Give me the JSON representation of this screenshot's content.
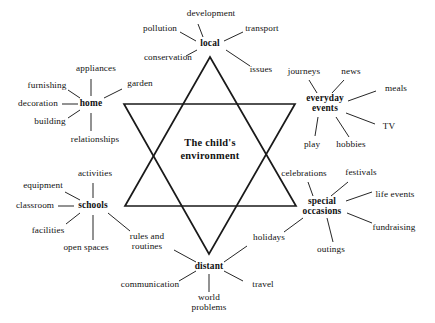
{
  "diagram": {
    "title": "The child's environment",
    "center": {
      "label": "The child's\nenvironment",
      "x": 210,
      "y": 150
    },
    "star": {
      "stroke_color": "#1a1a1a",
      "stroke_width": 1.7,
      "up_triangle": [
        [
          210,
          57
        ],
        [
          296,
          206
        ],
        [
          125,
          206
        ]
      ],
      "down_triangle": [
        [
          124,
          104
        ],
        [
          295,
          104
        ],
        [
          209,
          254
        ]
      ]
    },
    "nodes": [
      {
        "id": "local",
        "label": "local",
        "x": 210,
        "y": 44,
        "w": 30,
        "h": 11,
        "children": [
          {
            "label": "development",
            "x": 211,
            "y": 14,
            "anchor": "center"
          },
          {
            "label": "pollution",
            "x": 160,
            "y": 29,
            "anchor": "center"
          },
          {
            "label": "transport",
            "x": 262,
            "y": 29,
            "anchor": "center"
          },
          {
            "label": "conservation",
            "x": 168,
            "y": 58,
            "anchor": "center"
          },
          {
            "label": "issues",
            "x": 261,
            "y": 70,
            "anchor": "center"
          }
        ]
      },
      {
        "id": "home",
        "label": "home",
        "x": 91,
        "y": 104,
        "w": 28,
        "h": 11,
        "children": [
          {
            "label": "appliances",
            "x": 96,
            "y": 69,
            "anchor": "center"
          },
          {
            "label": "furnishing",
            "x": 47,
            "y": 86,
            "anchor": "center"
          },
          {
            "label": "garden",
            "x": 140,
            "y": 84,
            "anchor": "center"
          },
          {
            "label": "decoration",
            "x": 38,
            "y": 104,
            "anchor": "center"
          },
          {
            "label": "building",
            "x": 50,
            "y": 122,
            "anchor": "center"
          },
          {
            "label": "relationships",
            "x": 95,
            "y": 140,
            "anchor": "center"
          }
        ]
      },
      {
        "id": "schools",
        "label": "schools",
        "x": 93,
        "y": 206,
        "w": 34,
        "h": 11,
        "children": [
          {
            "label": "activities",
            "x": 95,
            "y": 174,
            "anchor": "center"
          },
          {
            "label": "equipment",
            "x": 43,
            "y": 186,
            "anchor": "center"
          },
          {
            "label": "classroom",
            "x": 35,
            "y": 206,
            "anchor": "center"
          },
          {
            "label": "facilities",
            "x": 48,
            "y": 231,
            "anchor": "center"
          },
          {
            "label": "open spaces",
            "x": 86,
            "y": 248,
            "anchor": "center"
          },
          {
            "label": "rules and\nroutines",
            "x": 147,
            "y": 242,
            "anchor": "center"
          }
        ]
      },
      {
        "id": "everyday-events",
        "label": "everyday\nevents",
        "x": 325,
        "y": 104,
        "w": 42,
        "h": 21,
        "children": [
          {
            "label": "journeys",
            "x": 304,
            "y": 72,
            "anchor": "center"
          },
          {
            "label": "news",
            "x": 351,
            "y": 72,
            "anchor": "center"
          },
          {
            "label": "meals",
            "x": 396,
            "y": 89,
            "anchor": "center"
          },
          {
            "label": "TV",
            "x": 389,
            "y": 127,
            "anchor": "center"
          },
          {
            "label": "hobbies",
            "x": 351,
            "y": 145,
            "anchor": "center"
          },
          {
            "label": "play",
            "x": 312,
            "y": 145,
            "anchor": "center"
          }
        ]
      },
      {
        "id": "special-occasions",
        "label": "special\noccasions",
        "x": 322,
        "y": 207,
        "w": 44,
        "h": 21,
        "children": [
          {
            "label": "celebrations",
            "x": 304,
            "y": 174,
            "anchor": "center"
          },
          {
            "label": "festivals",
            "x": 361,
            "y": 173,
            "anchor": "center"
          },
          {
            "label": "life events",
            "x": 395,
            "y": 195,
            "anchor": "center"
          },
          {
            "label": "fundraising",
            "x": 394,
            "y": 228,
            "anchor": "center"
          },
          {
            "label": "outings",
            "x": 331,
            "y": 250,
            "anchor": "center"
          },
          {
            "label": "holidays",
            "x": 269,
            "y": 238,
            "anchor": "center"
          }
        ]
      },
      {
        "id": "distant",
        "label": "distant",
        "x": 209,
        "y": 267,
        "w": 32,
        "h": 11,
        "children": [
          {
            "label": "communication",
            "x": 150,
            "y": 285,
            "anchor": "center"
          },
          {
            "label": "world\nproblems",
            "x": 209,
            "y": 303,
            "anchor": "center"
          },
          {
            "label": "travel",
            "x": 263,
            "y": 285,
            "anchor": "center"
          }
        ]
      }
    ],
    "spokes": [
      {
        "from": [
          203,
          37
        ],
        "to": [
          198,
          24
        ],
        "name": "local-development"
      },
      {
        "from": [
          196,
          41
        ],
        "to": [
          180,
          32
        ],
        "name": "local-pollution"
      },
      {
        "from": [
          224,
          41
        ],
        "to": [
          243,
          32
        ],
        "name": "local-transport"
      },
      {
        "from": [
          197,
          50
        ],
        "to": [
          186,
          56
        ],
        "name": "local-conservation"
      },
      {
        "from": [
          226,
          50
        ],
        "to": [
          250,
          66
        ],
        "name": "local-issues"
      },
      {
        "from": [
          91,
          96
        ],
        "to": [
          91,
          79
        ],
        "name": "home-appliances"
      },
      {
        "from": [
          80,
          98
        ],
        "to": [
          68,
          90
        ],
        "name": "home-furnishing"
      },
      {
        "from": [
          104,
          98
        ],
        "to": [
          122,
          89
        ],
        "name": "home-garden"
      },
      {
        "from": [
          78,
          104
        ],
        "to": [
          62,
          104
        ],
        "name": "home-decoration"
      },
      {
        "from": [
          80,
          110
        ],
        "to": [
          68,
          118
        ],
        "name": "home-building"
      },
      {
        "from": [
          91,
          113
        ],
        "to": [
          91,
          131
        ],
        "name": "home-relationships"
      },
      {
        "from": [
          93,
          198
        ],
        "to": [
          93,
          183
        ],
        "name": "schools-activities"
      },
      {
        "from": [
          80,
          200
        ],
        "to": [
          65,
          192
        ],
        "name": "schools-equipment"
      },
      {
        "from": [
          74,
          206
        ],
        "to": [
          58,
          206
        ],
        "name": "schools-classroom"
      },
      {
        "from": [
          80,
          213
        ],
        "to": [
          66,
          224
        ],
        "name": "schools-facilities"
      },
      {
        "from": [
          93,
          215
        ],
        "to": [
          93,
          240
        ],
        "name": "schools-openspaces"
      },
      {
        "from": [
          108,
          213
        ],
        "to": [
          130,
          231
        ],
        "name": "schools-rules"
      },
      {
        "from": [
          317,
          93
        ],
        "to": [
          309,
          80
        ],
        "name": "events-journeys"
      },
      {
        "from": [
          332,
          93
        ],
        "to": [
          344,
          80
        ],
        "name": "events-news"
      },
      {
        "from": [
          348,
          101
        ],
        "to": [
          376,
          91
        ],
        "name": "events-meals"
      },
      {
        "from": [
          346,
          113
        ],
        "to": [
          375,
          124
        ],
        "name": "events-tv"
      },
      {
        "from": [
          336,
          117
        ],
        "to": [
          349,
          137
        ],
        "name": "events-hobbies"
      },
      {
        "from": [
          318,
          117
        ],
        "to": [
          315,
          136
        ],
        "name": "events-play"
      },
      {
        "from": [
          313,
          196
        ],
        "to": [
          308,
          182
        ],
        "name": "occasions-celebrations"
      },
      {
        "from": [
          331,
          196
        ],
        "to": [
          348,
          182
        ],
        "name": "occasions-festivals"
      },
      {
        "from": [
          346,
          201
        ],
        "to": [
          372,
          192
        ],
        "name": "occasions-lifeevents"
      },
      {
        "from": [
          347,
          213
        ],
        "to": [
          372,
          223
        ],
        "name": "occasions-fundraising"
      },
      {
        "from": [
          327,
          218
        ],
        "to": [
          333,
          242
        ],
        "name": "occasions-outings"
      },
      {
        "from": [
          303,
          218
        ],
        "to": [
          284,
          232
        ],
        "name": "occasions-holidays"
      },
      {
        "from": [
          196,
          262
        ],
        "to": [
          174,
          250
        ],
        "name": "distant-rules"
      },
      {
        "from": [
          196,
          271
        ],
        "to": [
          179,
          281
        ],
        "name": "distant-communication"
      },
      {
        "from": [
          209,
          274
        ],
        "to": [
          209,
          292
        ],
        "name": "distant-world"
      },
      {
        "from": [
          224,
          271
        ],
        "to": [
          243,
          281
        ],
        "name": "distant-travel"
      },
      {
        "from": [
          224,
          262
        ],
        "to": [
          247,
          246
        ],
        "name": "distant-holidays"
      }
    ]
  }
}
